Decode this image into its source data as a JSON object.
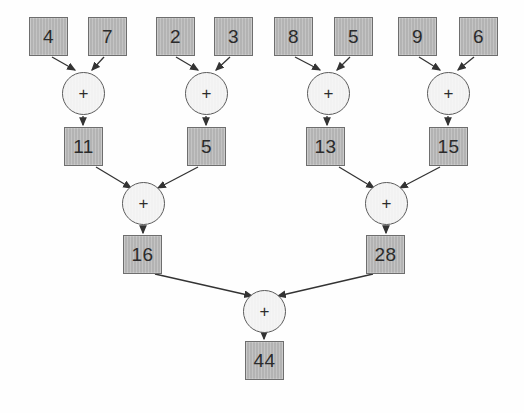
{
  "diagram": {
    "type": "computation-tree",
    "operator_symbol": "+",
    "colors": {
      "box_fill": "#b3b3b3",
      "box_stroke": "#6e6e6e",
      "circle_fill": "#f2f2f2",
      "circle_stroke": "#5a5a5a",
      "edge_stroke": "#333333",
      "background": "#fefefe",
      "text": "#2b2b2b"
    },
    "levels": [
      {
        "name": "inputs",
        "nodes": [
          {
            "id": "in1",
            "label": "4",
            "shape": "box",
            "x": 29,
            "y": 17,
            "w": 39,
            "h": 39
          },
          {
            "id": "in2",
            "label": "7",
            "shape": "box",
            "x": 88,
            "y": 17,
            "w": 39,
            "h": 39
          },
          {
            "id": "in3",
            "label": "2",
            "shape": "box",
            "x": 156,
            "y": 17,
            "w": 39,
            "h": 39
          },
          {
            "id": "in4",
            "label": "3",
            "shape": "box",
            "x": 214,
            "y": 17,
            "w": 39,
            "h": 39
          },
          {
            "id": "in5",
            "label": "8",
            "shape": "box",
            "x": 274,
            "y": 17,
            "w": 39,
            "h": 39
          },
          {
            "id": "in6",
            "label": "5",
            "shape": "box",
            "x": 334,
            "y": 17,
            "w": 39,
            "h": 39
          },
          {
            "id": "in7",
            "label": "9",
            "shape": "box",
            "x": 398,
            "y": 17,
            "w": 39,
            "h": 39
          },
          {
            "id": "in8",
            "label": "6",
            "shape": "box",
            "x": 459,
            "y": 17,
            "w": 39,
            "h": 39
          }
        ]
      },
      {
        "name": "adders-level-1",
        "nodes": [
          {
            "id": "add1",
            "label": "+",
            "shape": "circle",
            "x": 62,
            "y": 72,
            "w": 43,
            "h": 43
          },
          {
            "id": "add2",
            "label": "+",
            "shape": "circle",
            "x": 185,
            "y": 72,
            "w": 43,
            "h": 43
          },
          {
            "id": "add3",
            "label": "+",
            "shape": "circle",
            "x": 307,
            "y": 72,
            "w": 43,
            "h": 43
          },
          {
            "id": "add4",
            "label": "+",
            "shape": "circle",
            "x": 427,
            "y": 72,
            "w": 43,
            "h": 43
          }
        ]
      },
      {
        "name": "partial-sums-level-1",
        "nodes": [
          {
            "id": "sum1",
            "label": "11",
            "shape": "box",
            "x": 64,
            "y": 127,
            "w": 39,
            "h": 39
          },
          {
            "id": "sum2",
            "label": "5",
            "shape": "box",
            "x": 187,
            "y": 127,
            "w": 39,
            "h": 39
          },
          {
            "id": "sum3",
            "label": "13",
            "shape": "box",
            "x": 306,
            "y": 127,
            "w": 39,
            "h": 39
          },
          {
            "id": "sum4",
            "label": "15",
            "shape": "box",
            "x": 429,
            "y": 127,
            "w": 39,
            "h": 39
          }
        ]
      },
      {
        "name": "adders-level-2",
        "nodes": [
          {
            "id": "add5",
            "label": "+",
            "shape": "circle",
            "x": 122,
            "y": 182,
            "w": 43,
            "h": 43
          },
          {
            "id": "add6",
            "label": "+",
            "shape": "circle",
            "x": 365,
            "y": 182,
            "w": 43,
            "h": 43
          }
        ]
      },
      {
        "name": "partial-sums-level-2",
        "nodes": [
          {
            "id": "sum5",
            "label": "16",
            "shape": "box",
            "x": 123,
            "y": 235,
            "w": 39,
            "h": 39
          },
          {
            "id": "sum6",
            "label": "28",
            "shape": "box",
            "x": 366,
            "y": 235,
            "w": 39,
            "h": 39
          }
        ]
      },
      {
        "name": "adders-level-3",
        "nodes": [
          {
            "id": "add7",
            "label": "+",
            "shape": "circle",
            "x": 243,
            "y": 290,
            "w": 43,
            "h": 43
          }
        ]
      },
      {
        "name": "result",
        "nodes": [
          {
            "id": "total",
            "label": "44",
            "shape": "box",
            "x": 245,
            "y": 341,
            "w": 39,
            "h": 39
          }
        ]
      }
    ],
    "edges": [
      {
        "from": "in1",
        "to": "add1",
        "x1": 52,
        "y1": 57,
        "x2": 75,
        "y2": 70
      },
      {
        "from": "in2",
        "to": "add1",
        "x1": 104,
        "y1": 57,
        "x2": 92,
        "y2": 70
      },
      {
        "from": "add1",
        "to": "sum1",
        "x1": 83,
        "y1": 116,
        "x2": 83,
        "y2": 125
      },
      {
        "from": "in3",
        "to": "add2",
        "x1": 176,
        "y1": 57,
        "x2": 198,
        "y2": 70
      },
      {
        "from": "in4",
        "to": "add2",
        "x1": 230,
        "y1": 57,
        "x2": 216,
        "y2": 70
      },
      {
        "from": "add2",
        "to": "sum2",
        "x1": 206,
        "y1": 116,
        "x2": 206,
        "y2": 125
      },
      {
        "from": "in5",
        "to": "add3",
        "x1": 295,
        "y1": 57,
        "x2": 320,
        "y2": 70
      },
      {
        "from": "in6",
        "to": "add3",
        "x1": 350,
        "y1": 57,
        "x2": 337,
        "y2": 70
      },
      {
        "from": "add3",
        "to": "sum3",
        "x1": 327,
        "y1": 116,
        "x2": 327,
        "y2": 125
      },
      {
        "from": "in7",
        "to": "add4",
        "x1": 419,
        "y1": 57,
        "x2": 440,
        "y2": 70
      },
      {
        "from": "in8",
        "to": "add4",
        "x1": 474,
        "y1": 57,
        "x2": 458,
        "y2": 70
      },
      {
        "from": "add4",
        "to": "sum4",
        "x1": 448,
        "y1": 116,
        "x2": 448,
        "y2": 125
      },
      {
        "from": "sum1",
        "to": "add5",
        "x1": 96,
        "y1": 167,
        "x2": 131,
        "y2": 188
      },
      {
        "from": "sum2",
        "to": "add5",
        "x1": 198,
        "y1": 167,
        "x2": 158,
        "y2": 188
      },
      {
        "from": "add5",
        "to": "sum5",
        "x1": 143,
        "y1": 226,
        "x2": 143,
        "y2": 233
      },
      {
        "from": "sum3",
        "to": "add6",
        "x1": 339,
        "y1": 167,
        "x2": 374,
        "y2": 188
      },
      {
        "from": "sum4",
        "to": "add6",
        "x1": 440,
        "y1": 167,
        "x2": 400,
        "y2": 188
      },
      {
        "from": "add6",
        "to": "sum6",
        "x1": 386,
        "y1": 226,
        "x2": 386,
        "y2": 233
      },
      {
        "from": "sum5",
        "to": "add7",
        "x1": 155,
        "y1": 274,
        "x2": 252,
        "y2": 296
      },
      {
        "from": "sum6",
        "to": "add7",
        "x1": 373,
        "y1": 274,
        "x2": 278,
        "y2": 296
      },
      {
        "from": "add7",
        "to": "total",
        "x1": 264,
        "y1": 334,
        "x2": 264,
        "y2": 339
      }
    ]
  }
}
